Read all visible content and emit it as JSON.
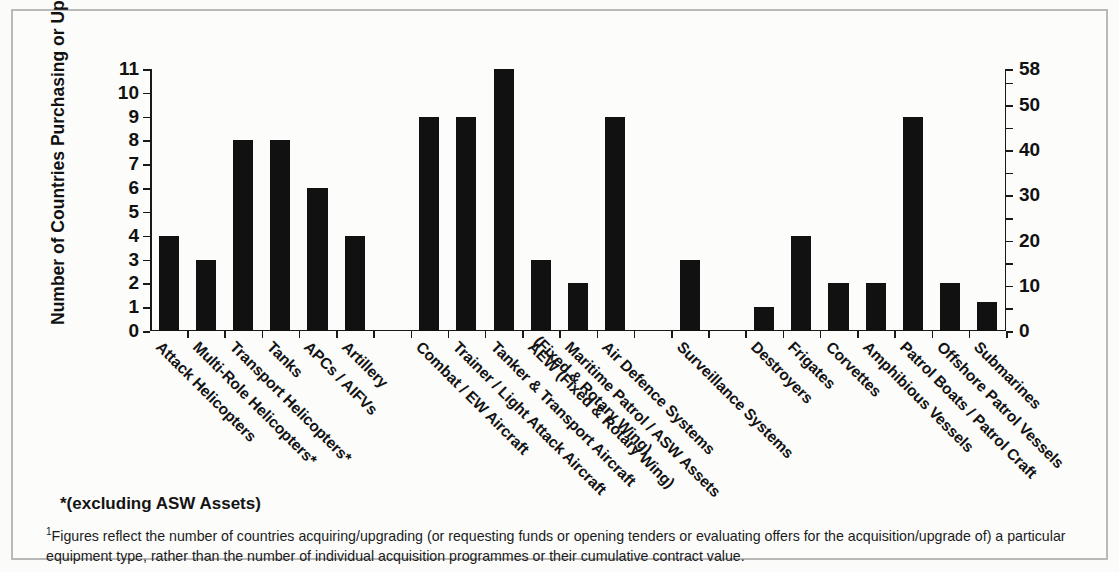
{
  "chart_data": {
    "type": "bar",
    "title": "",
    "ylabel": "Number of Countries Purchasing or Upgrading",
    "y2label": "Proportion of Region (%)",
    "xlabel": "",
    "ylim": [
      0,
      11
    ],
    "y2lim": [
      0,
      58
    ],
    "yticks": [
      "0",
      "1",
      "2",
      "3",
      "4",
      "5",
      "6",
      "7",
      "8",
      "9",
      "10",
      "11"
    ],
    "y2ticks": [
      "0",
      "10",
      "20",
      "30",
      "40",
      "50",
      "58"
    ],
    "grid": false,
    "legend": "none",
    "categories": [
      "Attack Helicopters",
      "Multi-Role Helicopters*",
      "Transport Helicopters*",
      "Tanks",
      "APCs / AIFVs",
      "Artillery",
      "",
      "Combat / EW Aircraft",
      "Trainer / Light Attack Aircraft",
      "Tanker & Transport Aircraft",
      "AEW (Fixed & Rotary Wing)",
      "Maritime Patrol / ASW Assets",
      "Air Defence Systems",
      "",
      "Surveillance Systems",
      "",
      "Destroyers",
      "Frigates",
      "Corvettes",
      "Amphibious Vessels",
      "Patrol Boats / Patrol Craft",
      "Offshore Patrol Vessels",
      "Submarines"
    ],
    "category_line2": [
      "",
      "",
      "",
      "",
      "",
      "",
      "",
      "",
      "",
      "",
      "",
      "(Fixed & Rotary Wing)",
      "",
      "",
      "",
      "",
      "",
      "",
      "",
      "",
      "",
      "",
      ""
    ],
    "values": [
      4,
      3,
      8,
      8,
      6,
      4,
      null,
      9,
      9,
      11,
      3,
      2,
      9,
      null,
      3,
      null,
      1,
      4,
      2,
      2,
      9,
      2,
      1.2
    ],
    "bar_color": "#111111"
  },
  "notes": {
    "asterisk": "*(excluding ASW Assets)",
    "footnote_marker": "1",
    "footnote": "Figures reflect the number of countries acquiring/upgrading (or requesting funds or opening tenders or evaluating offers for the acquisition/upgrade of) a particular equipment type, rather than the number of individual acquisition programmes or their cumulative contract value."
  },
  "style": {
    "frame_border": "#b9b9b9",
    "background": "#fcfcfb",
    "axis_color": "#1a1a1a",
    "text_color": "#131313"
  }
}
